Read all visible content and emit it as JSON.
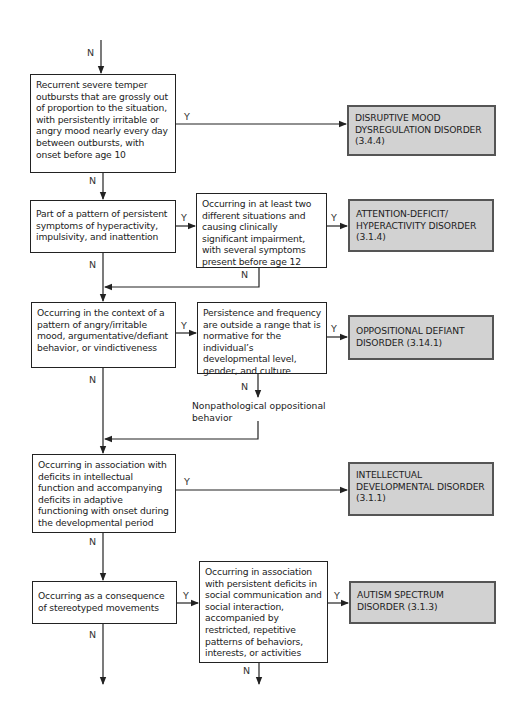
{
  "diagram": {
    "type": "decision-tree",
    "labels": {
      "yes": "Y",
      "no": "N"
    },
    "colors": {
      "outcome_fill": "#d2d2d2",
      "outcome_border": "#555555",
      "line": "#222222"
    },
    "decisions": [
      {
        "id": "d1",
        "text": "Recurrent severe temper outbursts that are grossly out of proportion to the situation, with persistently irritable or angry mood nearly every day between outbursts, with onset before age 10"
      },
      {
        "id": "d2",
        "text": "Part of a pattern of persistent symptoms of hyperactivity, impulsivity, and inattention"
      },
      {
        "id": "d3",
        "text": "Occurring in at least two different situations and causing clinically significant impairment, with several symptoms present before age 12"
      },
      {
        "id": "d4",
        "text": "Occurring in the context of a pattern of angry/irritable mood, argumentative/defiant behavior, or vindictiveness"
      },
      {
        "id": "d5",
        "text": "Persistence and frequency are outside a range that is normative for the individual’s developmental level, gender, and culture"
      },
      {
        "id": "d6",
        "text": "Occurring in association with deficits in intellectual function and accompanying deficits in adaptive functioning with onset during the developmental period"
      },
      {
        "id": "d7",
        "text": "Occurring as a consequence of stereotyped movements"
      },
      {
        "id": "d8",
        "text": "Occurring in association with persistent deficits in social communication and social interaction, accompanied by restricted, repetitive patterns of behaviors, interests, or activities"
      }
    ],
    "outcomes": [
      {
        "id": "o1",
        "text": "DISRUPTIVE MOOD DYSREGULATION DISORDER (3.4.4)"
      },
      {
        "id": "o2",
        "text": "ATTENTION-DEFICIT/ HYPERACTIVITY DISORDER (3.1.4)"
      },
      {
        "id": "o3",
        "text": "OPPOSITIONAL DEFIANT DISORDER (3.14.1)"
      },
      {
        "id": "o4",
        "text": "INTELLECTUAL DEVELOPMENTAL DISORDER (3.1.1)"
      },
      {
        "id": "o5",
        "text": "AUTISM SPECTRUM DISORDER (3.1.3)"
      }
    ],
    "notes": [
      {
        "id": "n1",
        "text": "Nonpathological oppositional behavior"
      }
    ],
    "edges": [
      {
        "from": "start",
        "to": "d1",
        "label": "N"
      },
      {
        "from": "d1",
        "to": "o1",
        "label": "Y"
      },
      {
        "from": "d1",
        "to": "d2",
        "label": "N"
      },
      {
        "from": "d2",
        "to": "d3",
        "label": "Y"
      },
      {
        "from": "d2",
        "to": "d4",
        "label": "N"
      },
      {
        "from": "d3",
        "to": "o2",
        "label": "Y"
      },
      {
        "from": "d3",
        "to": "d4",
        "label": "N"
      },
      {
        "from": "d4",
        "to": "d5",
        "label": "Y"
      },
      {
        "from": "d4",
        "to": "d6",
        "label": "N"
      },
      {
        "from": "d5",
        "to": "o3",
        "label": "Y"
      },
      {
        "from": "d5",
        "to": "n1",
        "label": "N"
      },
      {
        "from": "n1",
        "to": "d6",
        "label": ""
      },
      {
        "from": "d6",
        "to": "o4",
        "label": "Y"
      },
      {
        "from": "d6",
        "to": "d7",
        "label": "N"
      },
      {
        "from": "d7",
        "to": "d8",
        "label": "Y"
      },
      {
        "from": "d7",
        "to": "continue",
        "label": "N"
      },
      {
        "from": "d8",
        "to": "o5",
        "label": "Y"
      },
      {
        "from": "d8",
        "to": "continue",
        "label": "N"
      }
    ]
  }
}
